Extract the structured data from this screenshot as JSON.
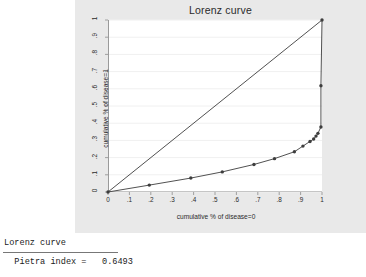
{
  "window": {
    "background_color": "#e9e9e9",
    "panel_color": "#ffffff"
  },
  "console": {
    "heading": "Lorenz curve",
    "result_line": "  Pietra index =   0.6493",
    "pietra_label": "Pietra index =",
    "pietra_value": "0.6493"
  },
  "chart_data": {
    "type": "line",
    "title": "Lorenz curve",
    "xlabel": "cumulative % of disease=0",
    "ylabel": "cumulative % of disease=1",
    "xlim": [
      0,
      1
    ],
    "ylim": [
      0,
      1
    ],
    "grid": false,
    "legend": "none",
    "xticks": [
      "0",
      ".1",
      ".2",
      ".3",
      ".4",
      ".5",
      ".6",
      ".7",
      ".8",
      ".9",
      "1"
    ],
    "xtick_values": [
      0,
      0.1,
      0.2,
      0.3,
      0.4,
      0.5,
      0.6,
      0.7,
      0.8,
      0.9,
      1
    ],
    "ytick_values": [
      0,
      0.1,
      0.2,
      0.3,
      0.4,
      0.5,
      0.6,
      0.7,
      0.8,
      0.9,
      1
    ],
    "yticks": [
      "0",
      ".1",
      ".2",
      ".3",
      ".4",
      ".5",
      ".6",
      ".7",
      ".8",
      ".9",
      "1"
    ],
    "series": [
      {
        "name": "lorenz-curve",
        "marker": "circle",
        "color": "#3d3d3d",
        "x": [
          0,
          0.193,
          0.387,
          0.534,
          0.682,
          0.778,
          0.871,
          0.911,
          0.944,
          0.961,
          0.972,
          0.981,
          0.995,
          0.995,
          1.0
        ],
        "y": [
          0,
          0.04,
          0.081,
          0.117,
          0.16,
          0.194,
          0.234,
          0.267,
          0.294,
          0.308,
          0.325,
          0.341,
          0.378,
          0.618,
          1.0
        ]
      },
      {
        "name": "equality-line",
        "marker": "none",
        "color": "#3d3d3d",
        "x": [
          0,
          1
        ],
        "y": [
          0,
          1
        ]
      }
    ]
  }
}
